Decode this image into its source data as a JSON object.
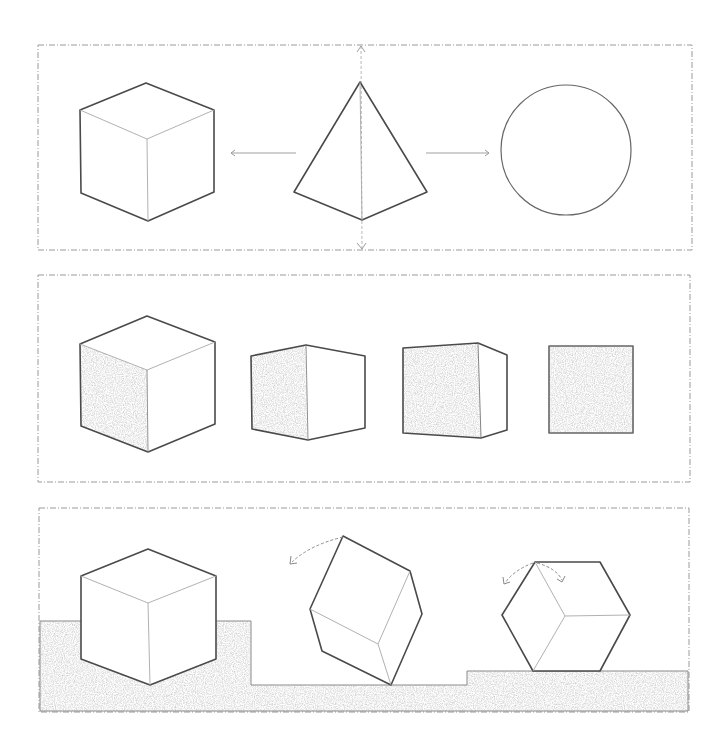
{
  "colors": {
    "background": "#ffffff",
    "line": "#4a4a4a",
    "construction_line": "#a8a8a8",
    "frame": "#9a9a9a",
    "shading": "#d8d8d8"
  },
  "panels": [
    {
      "name": "panel-projection",
      "description": "Isometric cube, pyramid view with vertical axis, and circle; arrows point left to cube and right to circle",
      "shapes": [
        "cube-outline",
        "pyramid-view",
        "circle"
      ],
      "arrows": [
        {
          "direction": "left",
          "from_x": 296,
          "to_x": 230,
          "y": 153
        },
        {
          "direction": "right",
          "from_x": 426,
          "to_x": 490,
          "y": 153
        }
      ]
    },
    {
      "name": "panel-rotation-views",
      "description": "Cube rotating from three-quarter view to front view, shaded face",
      "shapes": [
        "cube-isometric-shaded",
        "cube-corner-view",
        "cube-slight-turn",
        "square-front-view"
      ]
    },
    {
      "name": "panel-ground-balance",
      "description": "Cube resting on raised ground, cube tipping on an edge, cube balanced on a corner edge",
      "shapes": [
        "cube-on-ground",
        "cube-tipping",
        "cube-balanced"
      ],
      "rotation_arrows": 3
    }
  ],
  "icons": {
    "arrow_left": "arrow-left-icon",
    "arrow_right": "arrow-right-icon",
    "rotation": "rotation-arrow-icon"
  }
}
